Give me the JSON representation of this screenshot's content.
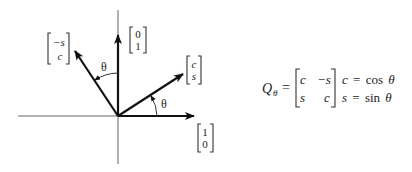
{
  "diagram": {
    "vectors": [
      {
        "id": "e1",
        "label_top": "1",
        "label_bottom": "0",
        "description": "unit x-axis vector"
      },
      {
        "id": "e2",
        "label_top": "0",
        "label_bottom": "1",
        "description": "unit y-axis vector"
      },
      {
        "id": "q1",
        "label_top": "c",
        "label_bottom": "s",
        "description": "rotated first column"
      },
      {
        "id": "q2",
        "label_top": "−s",
        "label_bottom": "c",
        "description": "rotated second column"
      }
    ],
    "angle_labels": [
      "θ",
      "θ"
    ]
  },
  "formula": {
    "lhs": "Q",
    "lhs_subscript": "θ",
    "equals": "=",
    "matrix": [
      [
        "c",
        "−s"
      ],
      [
        "s",
        "c"
      ]
    ],
    "definitions": [
      {
        "var": "c",
        "eq": "=",
        "fn": "cos",
        "arg": "θ"
      },
      {
        "var": "s",
        "eq": "=",
        "fn": "sin",
        "arg": "θ"
      }
    ]
  },
  "colors": {
    "ink": "#111111",
    "axis": "#555555",
    "background": "#ffffff"
  }
}
